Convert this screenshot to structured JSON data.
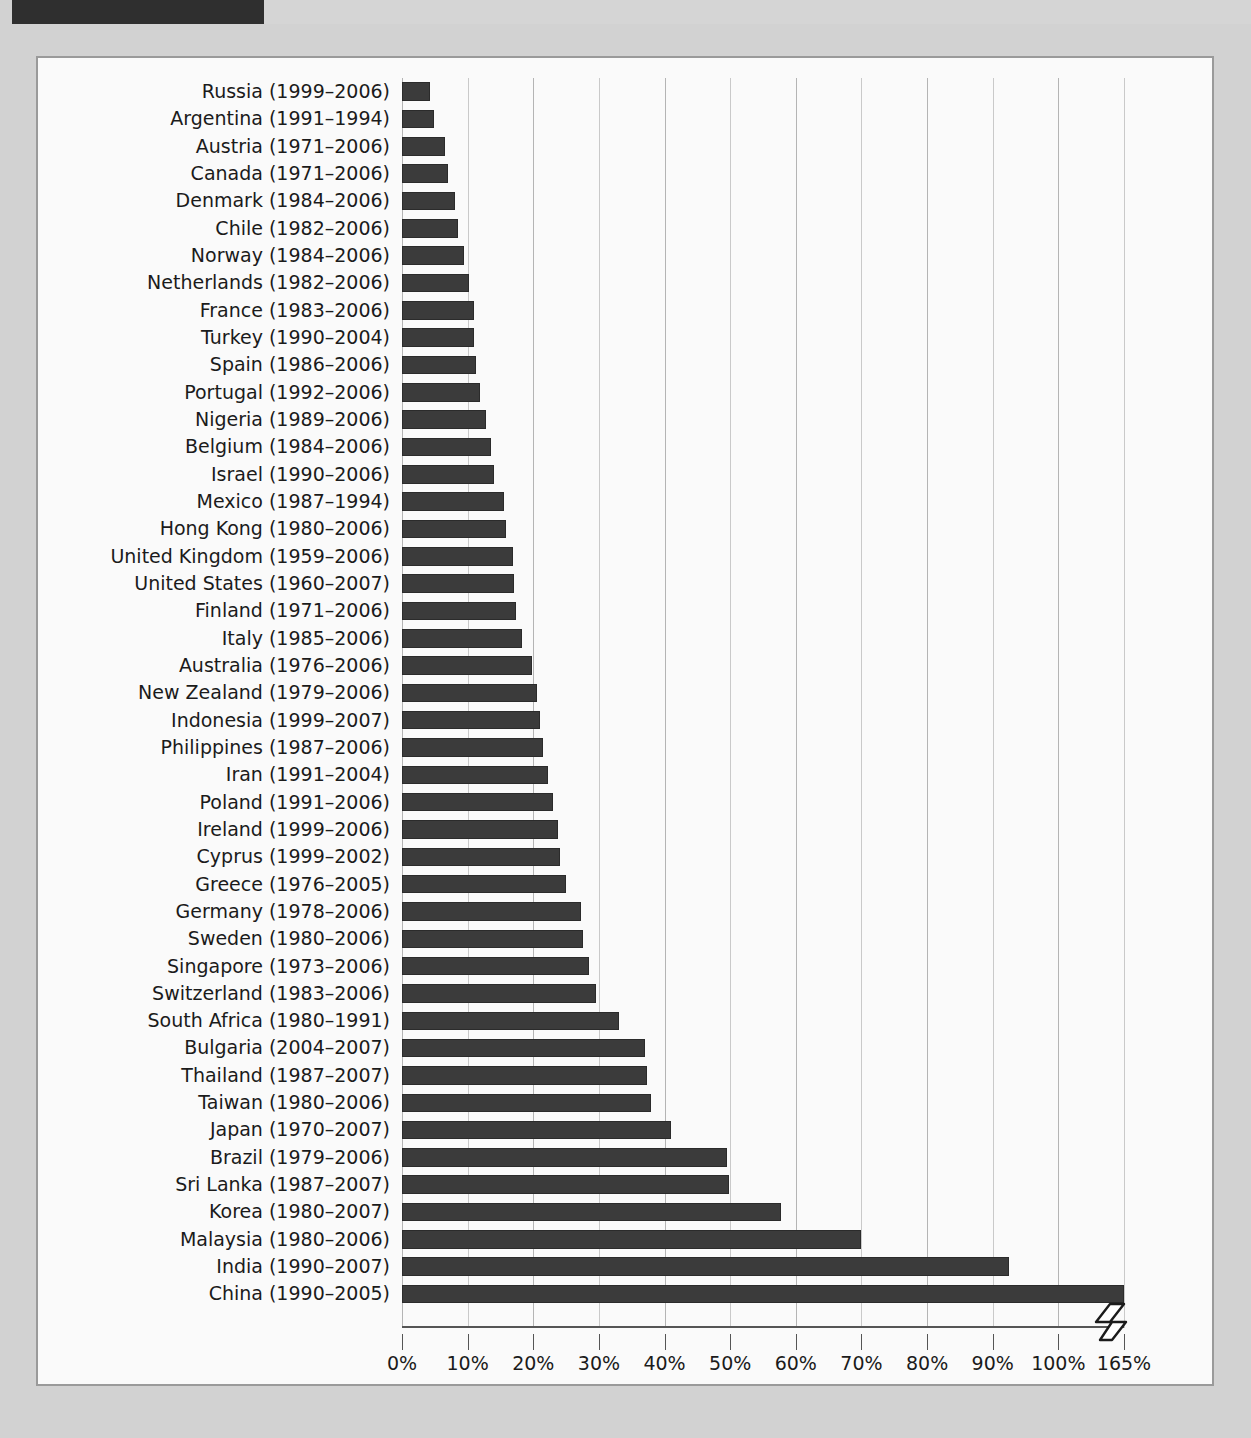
{
  "page": {
    "background_color": "#d2d2d2",
    "header_bar_color": "#2f2f2f"
  },
  "chart_data": {
    "type": "bar",
    "orientation": "horizontal",
    "title": "",
    "subtitle": "",
    "xlabel": "",
    "ylabel": "",
    "xlim": [
      0,
      110
    ],
    "xticks": [
      "0%",
      "10%",
      "20%",
      "30%",
      "40%",
      "50%",
      "60%",
      "70%",
      "80%",
      "90%",
      "100%",
      "165%"
    ],
    "xtick_values": [
      0,
      10,
      20,
      30,
      40,
      50,
      60,
      70,
      80,
      90,
      100,
      110
    ],
    "axis_break": {
      "present": true,
      "after_tick": "100%",
      "resumes_at": "165%",
      "symbol": "zigzag"
    },
    "grid": true,
    "legend": null,
    "bar_color": "#3b3b3b",
    "categories": [
      "Russia (1999–2006)",
      "Argentina (1991–1994)",
      "Austria (1971–2006)",
      "Canada (1971–2006)",
      "Denmark (1984–2006)",
      "Chile (1982–2006)",
      "Norway (1984–2006)",
      "Netherlands (1982–2006)",
      "France (1983–2006)",
      "Turkey (1990–2004)",
      "Spain (1986–2006)",
      "Portugal (1992–2006)",
      "Nigeria (1989–2006)",
      "Belgium (1984–2006)",
      "Israel (1990–2006)",
      "Mexico (1987–1994)",
      "Hong Kong (1980–2006)",
      "United Kingdom (1959–2006)",
      "United States (1960–2007)",
      "Finland (1971–2006)",
      "Italy (1985–2006)",
      "Australia (1976–2006)",
      "New Zealand (1979–2006)",
      "Indonesia (1999–2007)",
      "Philippines (1987–2006)",
      "Iran (1991–2004)",
      "Poland (1991–2006)",
      "Ireland (1999–2006)",
      "Cyprus (1999–2002)",
      "Greece (1976–2005)",
      "Germany (1978–2006)",
      "Sweden (1980–2006)",
      "Singapore (1973–2006)",
      "Switzerland (1983–2006)",
      "South Africa (1980–1991)",
      "Bulgaria (2004–2007)",
      "Thailand (1987–2007)",
      "Taiwan (1980–2006)",
      "Japan (1970–2007)",
      "Brazil (1979–2006)",
      "Sri Lanka (1987–2007)",
      "Korea (1980–2007)",
      "Malaysia (1980–2006)",
      "India (1990–2007)",
      "China (1990–2005)"
    ],
    "values": [
      4.2,
      4.8,
      6.6,
      7.0,
      8.1,
      8.5,
      9.5,
      10.2,
      10.9,
      11.0,
      11.2,
      11.9,
      12.8,
      13.6,
      14.0,
      15.5,
      15.9,
      16.9,
      17.0,
      17.4,
      18.3,
      19.8,
      20.5,
      21.1,
      21.5,
      22.3,
      23.0,
      23.8,
      24.0,
      25.0,
      27.2,
      27.6,
      28.5,
      29.6,
      33.0,
      37.0,
      37.4,
      38.0,
      41.0,
      49.5,
      49.8,
      57.8,
      70.0,
      92.5,
      165.0
    ],
    "rows": [
      {
        "country": "Russia",
        "years": "(1999–2006)",
        "value": 4.2
      },
      {
        "country": "Argentina",
        "years": "(1991–1994)",
        "value": 4.8
      },
      {
        "country": "Austria",
        "years": "(1971–2006)",
        "value": 6.6
      },
      {
        "country": "Canada",
        "years": "(1971–2006)",
        "value": 7.0
      },
      {
        "country": "Denmark",
        "years": "(1984–2006)",
        "value": 8.1
      },
      {
        "country": "Chile",
        "years": "(1982–2006)",
        "value": 8.5
      },
      {
        "country": "Norway",
        "years": "(1984–2006)",
        "value": 9.5
      },
      {
        "country": "Netherlands",
        "years": "(1982–2006)",
        "value": 10.2
      },
      {
        "country": "France",
        "years": "(1983–2006)",
        "value": 10.9
      },
      {
        "country": "Turkey",
        "years": "(1990–2004)",
        "value": 11.0
      },
      {
        "country": "Spain",
        "years": "(1986–2006)",
        "value": 11.2
      },
      {
        "country": "Portugal",
        "years": "(1992–2006)",
        "value": 11.9
      },
      {
        "country": "Nigeria",
        "years": "(1989–2006)",
        "value": 12.8
      },
      {
        "country": "Belgium",
        "years": "(1984–2006)",
        "value": 13.6
      },
      {
        "country": "Israel",
        "years": "(1990–2006)",
        "value": 14.0
      },
      {
        "country": "Mexico",
        "years": "(1987–1994)",
        "value": 15.5
      },
      {
        "country": "Hong Kong",
        "years": "(1980–2006)",
        "value": 15.9
      },
      {
        "country": "United Kingdom",
        "years": "(1959–2006)",
        "value": 16.9
      },
      {
        "country": "United States",
        "years": "(1960–2007)",
        "value": 17.0
      },
      {
        "country": "Finland",
        "years": "(1971–2006)",
        "value": 17.4
      },
      {
        "country": "Italy",
        "years": "(1985–2006)",
        "value": 18.3
      },
      {
        "country": "Australia",
        "years": "(1976–2006)",
        "value": 19.8
      },
      {
        "country": "New Zealand",
        "years": "(1979–2006)",
        "value": 20.5
      },
      {
        "country": "Indonesia",
        "years": "(1999–2007)",
        "value": 21.1
      },
      {
        "country": "Philippines",
        "years": "(1987–2006)",
        "value": 21.5
      },
      {
        "country": "Iran",
        "years": "(1991–2004)",
        "value": 22.3
      },
      {
        "country": "Poland",
        "years": "(1991–2006)",
        "value": 23.0
      },
      {
        "country": "Ireland",
        "years": "(1999–2006)",
        "value": 23.8
      },
      {
        "country": "Cyprus",
        "years": "(1999–2002)",
        "value": 24.0
      },
      {
        "country": "Greece",
        "years": "(1976–2005)",
        "value": 25.0
      },
      {
        "country": "Germany",
        "years": "(1978–2006)",
        "value": 27.2
      },
      {
        "country": "Sweden",
        "years": "(1980–2006)",
        "value": 27.6
      },
      {
        "country": "Singapore",
        "years": "(1973–2006)",
        "value": 28.5
      },
      {
        "country": "Switzerland",
        "years": "(1983–2006)",
        "value": 29.6
      },
      {
        "country": "South Africa",
        "years": "(1980–1991)",
        "value": 33.0
      },
      {
        "country": "Bulgaria",
        "years": "(2004–2007)",
        "value": 37.0
      },
      {
        "country": "Thailand",
        "years": "(1987–2007)",
        "value": 37.4
      },
      {
        "country": "Taiwan",
        "years": "(1980–2006)",
        "value": 38.0
      },
      {
        "country": "Japan",
        "years": "(1970–2007)",
        "value": 41.0
      },
      {
        "country": "Brazil",
        "years": "(1979–2006)",
        "value": 49.5
      },
      {
        "country": "Sri Lanka",
        "years": "(1987–2007)",
        "value": 49.8
      },
      {
        "country": "Korea",
        "years": "(1980–2007)",
        "value": 57.8
      },
      {
        "country": "Malaysia",
        "years": "(1980–2006)",
        "value": 70.0
      },
      {
        "country": "India",
        "years": "(1990–2007)",
        "value": 92.5
      },
      {
        "country": "China",
        "years": "(1990–2005)",
        "value": 165.0
      }
    ]
  }
}
